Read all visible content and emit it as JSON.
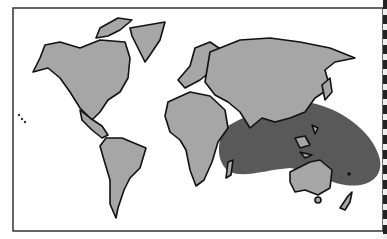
{
  "map": {
    "title": "",
    "type": "world distribution map",
    "colors": {
      "background": "#ffffff",
      "land": "#a6a6a6",
      "range_region": "#595959",
      "outline": "#111111"
    },
    "regions": [
      {
        "name": "North America"
      },
      {
        "name": "Greenland"
      },
      {
        "name": "South America"
      },
      {
        "name": "Europe"
      },
      {
        "name": "Africa"
      },
      {
        "name": "Asia"
      },
      {
        "name": "Australia"
      },
      {
        "name": "New Zealand"
      },
      {
        "name": "Madagascar"
      }
    ],
    "highlighted_range": {
      "description": "Indian Ocean to western Pacific shaded range",
      "marker": "dot"
    }
  }
}
